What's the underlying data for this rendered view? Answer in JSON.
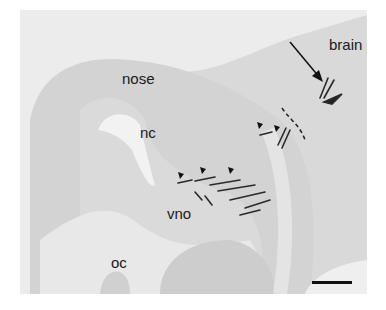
{
  "figure": {
    "type": "histology micrograph (sagittal section)",
    "labels": {
      "nose": "nose",
      "nc": "nc",
      "vno": "vno",
      "oc": "oc",
      "brain": "brain"
    },
    "annotations": {
      "arrow": "arrow pointing to stained axons near brain",
      "arrowheads_count": 5,
      "dashed_line": "dashed boundary line",
      "scale_bar": "scale bar (unlabeled)"
    },
    "colors": {
      "background": "#ececec",
      "tissue_light": "#dcdcdc",
      "tissue_mid": "#cfcfcf",
      "stain": "#2a2a2a"
    }
  }
}
